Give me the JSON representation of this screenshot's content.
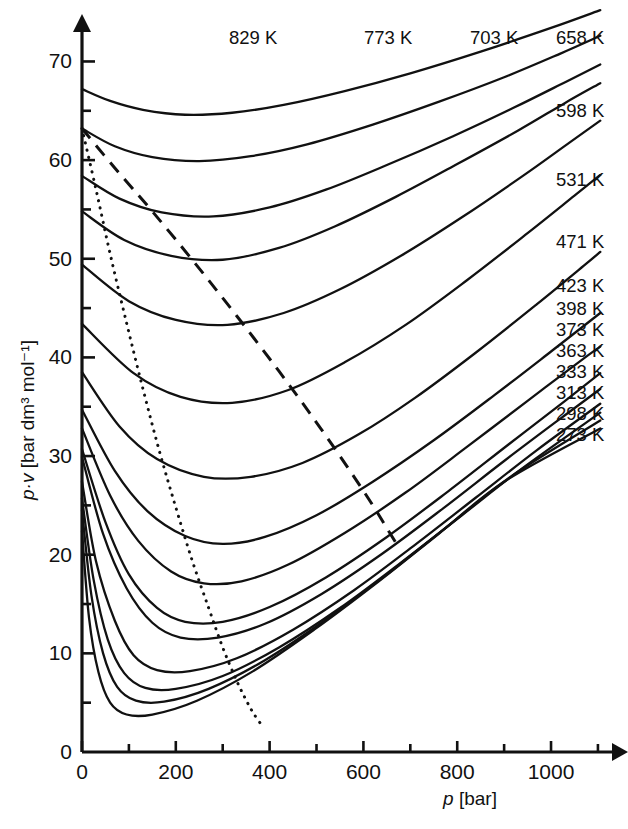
{
  "chart_data": {
    "type": "line",
    "title": "",
    "xlabel": "p [bar]",
    "ylabel": "p·v [bar dm³ mol⁻¹]",
    "xlabel_parts": {
      "symbol": "p",
      "unit": "[bar]"
    },
    "ylabel_parts": {
      "symbol": "p·v",
      "unit": "[bar dm³ mol⁻¹]"
    },
    "xlim": [
      0,
      1130
    ],
    "ylim": [
      0,
      74
    ],
    "xticks": [
      0,
      200,
      400,
      600,
      800,
      1000
    ],
    "xtick_labels": [
      "0",
      "200",
      "400",
      "600",
      "800",
      "1000"
    ],
    "xminorticks": [
      100,
      300,
      500,
      700,
      900,
      1100
    ],
    "yticks": [
      0,
      10,
      20,
      30,
      40,
      50,
      60,
      70
    ],
    "ytick_labels": [
      "0",
      "10",
      "20",
      "30",
      "40",
      "50",
      "60",
      "70"
    ],
    "yminorticks": [
      5,
      15,
      25,
      35,
      45,
      55,
      65
    ],
    "grid": false,
    "legend_position": "inline-right-end-labels",
    "units": {
      "temperature": "K",
      "pressure": "bar",
      "pv": "bar dm3 mol-1"
    },
    "series": [
      {
        "name": "829 K",
        "temperature": 829,
        "label": "829 K",
        "label_x": 229,
        "label_y": 44,
        "style": "solid",
        "points": [
          [
            0,
            67.2
          ],
          [
            60,
            66.0
          ],
          [
            130,
            65.1
          ],
          [
            220,
            64.6
          ],
          [
            320,
            64.8
          ],
          [
            430,
            65.6
          ],
          [
            560,
            67.0
          ],
          [
            700,
            68.8
          ],
          [
            850,
            71.0
          ],
          [
            1000,
            73.4
          ],
          [
            1105,
            75.2
          ]
        ]
      },
      {
        "name": "773 K",
        "temperature": 773,
        "label": "773 K",
        "label_x": 364,
        "label_y": 44,
        "style": "solid",
        "points": [
          [
            0,
            63.2
          ],
          [
            70,
            61.4
          ],
          [
            150,
            60.3
          ],
          [
            250,
            59.9
          ],
          [
            360,
            60.4
          ],
          [
            480,
            61.6
          ],
          [
            620,
            63.6
          ],
          [
            760,
            65.9
          ],
          [
            900,
            68.4
          ],
          [
            1020,
            70.8
          ],
          [
            1105,
            72.6
          ]
        ]
      },
      {
        "name": "703 K",
        "temperature": 703,
        "label": "703 K",
        "label_x": 470,
        "label_y": 44,
        "style": "solid",
        "points": [
          [
            0,
            58.4
          ],
          [
            80,
            56.1
          ],
          [
            170,
            54.7
          ],
          [
            280,
            54.3
          ],
          [
            400,
            55.2
          ],
          [
            520,
            57.0
          ],
          [
            650,
            59.5
          ],
          [
            790,
            62.4
          ],
          [
            920,
            65.3
          ],
          [
            1030,
            67.9
          ],
          [
            1105,
            69.7
          ]
        ]
      },
      {
        "name": "658 K",
        "temperature": 658,
        "label": "658 K",
        "label_x": 556,
        "label_y": 44,
        "style": "solid",
        "points": [
          [
            0,
            54.8
          ],
          [
            90,
            51.9
          ],
          [
            190,
            50.3
          ],
          [
            300,
            49.9
          ],
          [
            420,
            51.1
          ],
          [
            540,
            53.3
          ],
          [
            670,
            56.3
          ],
          [
            800,
            59.6
          ],
          [
            930,
            63.0
          ],
          [
            1030,
            65.8
          ],
          [
            1105,
            67.8
          ]
        ]
      },
      {
        "name": "598 K",
        "temperature": 598,
        "label": "598 K",
        "label_x": 556,
        "label_y": 117,
        "style": "solid",
        "points": [
          [
            0,
            49.4
          ],
          [
            100,
            45.7
          ],
          [
            200,
            43.8
          ],
          [
            310,
            43.3
          ],
          [
            430,
            44.5
          ],
          [
            550,
            46.9
          ],
          [
            680,
            50.3
          ],
          [
            810,
            54.2
          ],
          [
            940,
            58.4
          ],
          [
            1040,
            61.8
          ],
          [
            1105,
            64.0
          ]
        ]
      },
      {
        "name": "531 K",
        "temperature": 531,
        "label": "531 K",
        "label_x": 556,
        "label_y": 186,
        "style": "solid",
        "points": [
          [
            0,
            43.4
          ],
          [
            110,
            38.4
          ],
          [
            210,
            36.0
          ],
          [
            320,
            35.4
          ],
          [
            440,
            36.7
          ],
          [
            560,
            39.5
          ],
          [
            690,
            43.3
          ],
          [
            820,
            47.8
          ],
          [
            950,
            52.6
          ],
          [
            1050,
            56.4
          ],
          [
            1105,
            58.5
          ]
        ]
      },
      {
        "name": "471 K",
        "temperature": 471,
        "label": "471 K",
        "label_x": 556,
        "label_y": 248,
        "style": "solid",
        "points": [
          [
            0,
            38.5
          ],
          [
            80,
            33.0
          ],
          [
            160,
            29.7
          ],
          [
            260,
            27.9
          ],
          [
            360,
            27.9
          ],
          [
            470,
            29.3
          ],
          [
            590,
            32.2
          ],
          [
            710,
            35.9
          ],
          [
            840,
            40.5
          ],
          [
            970,
            45.4
          ],
          [
            1070,
            49.3
          ],
          [
            1105,
            50.7
          ]
        ]
      },
      {
        "name": "423 K",
        "temperature": 423,
        "label": "423 K",
        "label_x": 556,
        "label_y": 292,
        "style": "solid",
        "points": [
          [
            0,
            34.7
          ],
          [
            70,
            28.5
          ],
          [
            140,
            24.4
          ],
          [
            220,
            21.9
          ],
          [
            300,
            21.1
          ],
          [
            390,
            21.8
          ],
          [
            500,
            24.0
          ],
          [
            620,
            27.4
          ],
          [
            750,
            31.6
          ],
          [
            880,
            36.2
          ],
          [
            1000,
            40.6
          ],
          [
            1105,
            44.5
          ]
        ]
      },
      {
        "name": "398 K",
        "temperature": 398,
        "label": "398 K",
        "label_x": 556,
        "label_y": 315,
        "style": "solid",
        "points": [
          [
            0,
            32.8
          ],
          [
            60,
            26.0
          ],
          [
            120,
            21.4
          ],
          [
            190,
            18.3
          ],
          [
            260,
            17.1
          ],
          [
            340,
            17.3
          ],
          [
            440,
            19.0
          ],
          [
            560,
            22.2
          ],
          [
            690,
            26.3
          ],
          [
            820,
            30.9
          ],
          [
            950,
            35.6
          ],
          [
            1070,
            39.9
          ],
          [
            1105,
            41.1
          ]
        ]
      },
      {
        "name": "373 K",
        "temperature": 373,
        "label": "373 K",
        "label_x": 556,
        "label_y": 336,
        "style": "solid",
        "points": [
          [
            0,
            30.7
          ],
          [
            50,
            23.3
          ],
          [
            100,
            18.0
          ],
          [
            160,
            14.6
          ],
          [
            220,
            13.2
          ],
          [
            300,
            13.2
          ],
          [
            400,
            14.7
          ],
          [
            520,
            17.7
          ],
          [
            650,
            21.8
          ],
          [
            780,
            26.4
          ],
          [
            910,
            31.2
          ],
          [
            1030,
            35.6
          ],
          [
            1105,
            38.4
          ]
        ]
      },
      {
        "name": "363 K",
        "temperature": 363,
        "label": "363 K",
        "label_x": 556,
        "label_y": 357,
        "style": "solid",
        "points": [
          [
            0,
            29.9
          ],
          [
            45,
            22.1
          ],
          [
            95,
            16.6
          ],
          [
            150,
            13.1
          ],
          [
            210,
            11.6
          ],
          [
            290,
            11.6
          ],
          [
            390,
            13.0
          ],
          [
            510,
            16.0
          ],
          [
            640,
            20.1
          ],
          [
            770,
            24.7
          ],
          [
            900,
            29.5
          ],
          [
            1020,
            33.8
          ],
          [
            1105,
            36.8
          ]
        ]
      },
      {
        "name": "333 K",
        "temperature": 333,
        "label": "333 K",
        "label_x": 556,
        "label_y": 378,
        "style": "solid",
        "points": [
          [
            0,
            27.4
          ],
          [
            30,
            19.3
          ],
          [
            70,
            13.3
          ],
          [
            110,
            9.8
          ],
          [
            160,
            8.3
          ],
          [
            230,
            8.2
          ],
          [
            330,
            9.5
          ],
          [
            450,
            12.4
          ],
          [
            580,
            16.4
          ],
          [
            710,
            21.0
          ],
          [
            840,
            25.8
          ],
          [
            970,
            30.6
          ],
          [
            1105,
            35.3
          ]
        ]
      },
      {
        "name": "313 K",
        "temperature": 313,
        "label": "313 K",
        "label_x": 556,
        "label_y": 399,
        "style": "solid",
        "points": [
          [
            0,
            25.7
          ],
          [
            25,
            17.4
          ],
          [
            55,
            11.4
          ],
          [
            90,
            8.0
          ],
          [
            135,
            6.5
          ],
          [
            200,
            6.4
          ],
          [
            300,
            7.7
          ],
          [
            420,
            10.6
          ],
          [
            550,
            14.6
          ],
          [
            680,
            19.2
          ],
          [
            810,
            24.0
          ],
          [
            940,
            28.8
          ],
          [
            1105,
            34.4
          ]
        ]
      },
      {
        "name": "298 K",
        "temperature": 298,
        "label": "298 K",
        "label_x": 556,
        "label_y": 420,
        "style": "solid",
        "points": [
          [
            0,
            24.5
          ],
          [
            20,
            15.9
          ],
          [
            45,
            10.0
          ],
          [
            75,
            6.6
          ],
          [
            115,
            5.2
          ],
          [
            175,
            5.1
          ],
          [
            270,
            6.4
          ],
          [
            390,
            9.3
          ],
          [
            520,
            13.4
          ],
          [
            650,
            18.0
          ],
          [
            780,
            22.9
          ],
          [
            920,
            28.1
          ],
          [
            1105,
            33.6
          ]
        ]
      },
      {
        "name": "273 K",
        "temperature": 273,
        "label": "273 K",
        "label_x": 556,
        "label_y": 441,
        "style": "solid",
        "points": [
          [
            0,
            22.4
          ],
          [
            15,
            13.6
          ],
          [
            35,
            8.1
          ],
          [
            60,
            5.0
          ],
          [
            95,
            3.8
          ],
          [
            150,
            3.8
          ],
          [
            245,
            5.2
          ],
          [
            365,
            8.2
          ],
          [
            495,
            12.4
          ],
          [
            630,
            17.2
          ],
          [
            760,
            22.1
          ],
          [
            900,
            27.4
          ],
          [
            1105,
            32.8
          ]
        ]
      }
    ],
    "auxiliary_curves": [
      {
        "name": "minima-locus",
        "style": "dotted",
        "description": "Locus of isotherm minima (Boyle curve)",
        "points": [
          [
            0,
            63.2
          ],
          [
            30,
            57.0
          ],
          [
            60,
            50.5
          ],
          [
            95,
            43.5
          ],
          [
            130,
            36.8
          ],
          [
            165,
            30.5
          ],
          [
            200,
            24.8
          ],
          [
            235,
            19.4
          ],
          [
            270,
            14.6
          ],
          [
            300,
            10.6
          ],
          [
            330,
            7.2
          ],
          [
            355,
            4.8
          ],
          [
            370,
            3.6
          ],
          [
            382,
            2.8
          ]
        ]
      },
      {
        "name": "inflection-locus",
        "style": "dashed",
        "description": "Second locus crossing the isotherms at higher pressure",
        "points": [
          [
            0,
            63.2
          ],
          [
            70,
            59.2
          ],
          [
            150,
            54.8
          ],
          [
            240,
            49.6
          ],
          [
            330,
            44.2
          ],
          [
            420,
            38.6
          ],
          [
            500,
            33.4
          ],
          [
            570,
            28.6
          ],
          [
            620,
            25.0
          ],
          [
            655,
            22.3
          ],
          [
            672,
            21.0
          ]
        ]
      }
    ],
    "axis_notes": {
      "x_axis_has_arrow": true,
      "y_axis_has_arrow": true,
      "origin_label": "0"
    }
  }
}
